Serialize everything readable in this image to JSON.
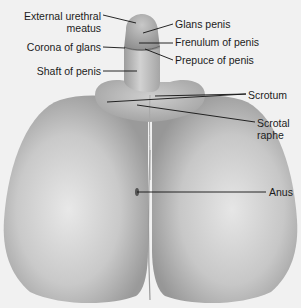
{
  "diagram": {
    "colors": {
      "background": "#f1f1f1",
      "skin_light": "#e6e6e6",
      "skin_mid": "#bdbdbd",
      "skin_dark": "#8a8a8a",
      "leader": "#111111",
      "text": "#1c1c1c"
    },
    "labels": [
      {
        "id": "external-urethral-meatus",
        "line1": "External urethral",
        "line2": "meatus",
        "x": 2,
        "y": 10,
        "w": 99,
        "align": "right"
      },
      {
        "id": "corona-of-glans",
        "line1": "Corona of glans",
        "line2": "",
        "x": 2,
        "y": 41,
        "w": 99,
        "align": "right"
      },
      {
        "id": "shaft-of-penis",
        "line1": "Shaft of penis",
        "line2": "",
        "x": 2,
        "y": 65,
        "w": 99,
        "align": "right"
      },
      {
        "id": "glans-penis",
        "line1": "Glans penis",
        "line2": "",
        "x": 175,
        "y": 18,
        "w": 100,
        "align": "left"
      },
      {
        "id": "frenulum-of-penis",
        "line1": "Frenulum of penis",
        "line2": "",
        "x": 175,
        "y": 36,
        "w": 110,
        "align": "left"
      },
      {
        "id": "prepuce-of-penis",
        "line1": "Prepuce of penis",
        "line2": "",
        "x": 175,
        "y": 54,
        "w": 110,
        "align": "left"
      },
      {
        "id": "scrotum",
        "line1": "Scrotum",
        "line2": "",
        "x": 248,
        "y": 89,
        "w": 50,
        "align": "left"
      },
      {
        "id": "scrotal-raphe",
        "line1": "Scrotal",
        "line2": "raphe",
        "x": 257,
        "y": 117,
        "w": 40,
        "align": "left"
      },
      {
        "id": "anus",
        "line1": "Anus",
        "line2": "",
        "x": 269,
        "y": 186,
        "w": 30,
        "align": "left"
      }
    ],
    "leaders": [
      {
        "id": "external-urethral-meatus",
        "x1": 103,
        "y1": 15,
        "x2": 136,
        "y2": 23
      },
      {
        "id": "corona-of-glans",
        "x1": 103,
        "y1": 47,
        "x2": 125,
        "y2": 48
      },
      {
        "id": "shaft-of-penis",
        "x1": 103,
        "y1": 71,
        "x2": 137,
        "y2": 71
      },
      {
        "id": "glans-penis",
        "x1": 173,
        "y1": 24,
        "x2": 143,
        "y2": 33
      },
      {
        "id": "frenulum-of-penis",
        "x1": 173,
        "y1": 43,
        "x2": 139,
        "y2": 43
      },
      {
        "id": "prepuce-of-penis",
        "x1": 173,
        "y1": 60,
        "x2": 145,
        "y2": 49
      },
      {
        "id": "scrotum-1",
        "x1": 246,
        "y1": 94,
        "x2": 155,
        "y2": 96
      },
      {
        "id": "scrotum-2",
        "x1": 246,
        "y1": 94,
        "x2": 107,
        "y2": 102
      },
      {
        "id": "scrotal-raphe",
        "x1": 255,
        "y1": 122,
        "x2": 137,
        "y2": 105
      },
      {
        "id": "anus",
        "x1": 266,
        "y1": 192,
        "x2": 137,
        "y2": 192
      }
    ]
  }
}
